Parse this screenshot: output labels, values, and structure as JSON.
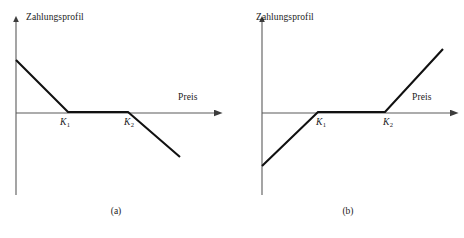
{
  "figure": {
    "background_color": "#ffffff",
    "line_color": "#111111",
    "axis_color": "#5a5a5a"
  },
  "panels": [
    {
      "id": "a",
      "caption": "(a)",
      "y_axis_label": "Zahlungsprofil",
      "x_axis_label": "Preis",
      "strike_labels": [
        {
          "symbol": "K",
          "subscript": "1"
        },
        {
          "symbol": "K",
          "subscript": "2"
        }
      ],
      "chart_data": {
        "type": "line",
        "title": "",
        "xlabel": "Preis",
        "ylabel": "Zahlungsprofil",
        "xlim": [
          0,
          232
        ],
        "ylim": [
          -60,
          60
        ],
        "grid": false,
        "legend": null,
        "annotations": [
          "K_1",
          "K_2"
        ],
        "series": [
          {
            "name": "Zahlungsprofil",
            "description": "Short strangle payoff: negative slope below K1, flat zero between K1 and K2, negative slope above K2",
            "x": [
              16,
              68,
              128,
              180
            ],
            "y": [
              52,
              0,
              0,
              -45
            ]
          }
        ],
        "axes": {
          "y_axis": {
            "x": 16,
            "y_top": 18,
            "y_bottom": 195
          },
          "x_axis": {
            "y": 113,
            "x_left": 16,
            "x_right": 222
          }
        },
        "strikes": {
          "K1": 68,
          "K2": 128
        }
      }
    },
    {
      "id": "b",
      "caption": "(b)",
      "y_axis_label": "Zahlungsprofil",
      "x_axis_label": "Preis",
      "strike_labels": [
        {
          "symbol": "K",
          "subscript": "1"
        },
        {
          "symbol": "K",
          "subscript": "2"
        }
      ],
      "chart_data": {
        "type": "line",
        "title": "",
        "xlabel": "Preis",
        "ylabel": "Zahlungsprofil",
        "xlim": [
          0,
          232
        ],
        "ylim": [
          -60,
          70
        ],
        "grid": false,
        "legend": null,
        "annotations": [
          "K_1",
          "K_2"
        ],
        "series": [
          {
            "name": "Zahlungsprofil",
            "description": "Long strangle payoff: positive slope below K1, flat zero between K1 and K2, positive slope above K2",
            "x": [
              30,
              86,
              153,
              211
            ],
            "y": [
              -54,
              0,
              0,
              63
            ]
          }
        ],
        "axes": {
          "y_axis": {
            "x": 30,
            "y_top": 18,
            "y_bottom": 195
          },
          "x_axis": {
            "y": 113,
            "x_left": 30,
            "x_right": 226
          }
        },
        "strikes": {
          "K1": 86,
          "K2": 153
        }
      }
    }
  ]
}
